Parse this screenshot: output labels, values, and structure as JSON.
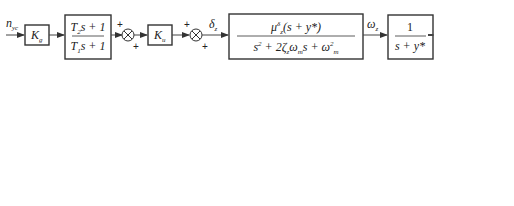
{
  "diagram": {
    "type": "block-diagram",
    "input_label": "n_yc",
    "output_label": "n_y",
    "blocks": {
      "kg": {
        "label": "K_g"
      },
      "lead": {
        "numerator": "T_2 s + 1",
        "denominator": "T_1 s + 1"
      },
      "ku": {
        "label": "K_u"
      },
      "plant": {
        "numerator": "μ^{δ}_{z}(s + y*)",
        "denominator": "s² + 2ζ_m ω_m s + ω²_m"
      },
      "integrator": {
        "numerator": "1",
        "denominator": "s + y*"
      },
      "gain_out": {
        "numerator": "vy*",
        "denominator": "57.3g"
      },
      "filter_left": {
        "numerator": "K",
        "denominator": "s + K"
      },
      "kphi": {
        "label": "K_φ"
      },
      "filter_bottom": {
        "numerator": "K",
        "denominator": "s + K"
      },
      "two_kw": {
        "label": "2K_ω1"
      }
    },
    "signals": {
      "delta": "δ_z",
      "omega": "ω_z",
      "alpha": "α"
    },
    "summers": [
      {
        "id": "sum1",
        "signs": [
          "+",
          "+"
        ]
      },
      {
        "id": "sum2",
        "signs": [
          "+",
          "+"
        ]
      },
      {
        "id": "sum3",
        "signs": [
          "+",
          "+"
        ]
      }
    ]
  }
}
